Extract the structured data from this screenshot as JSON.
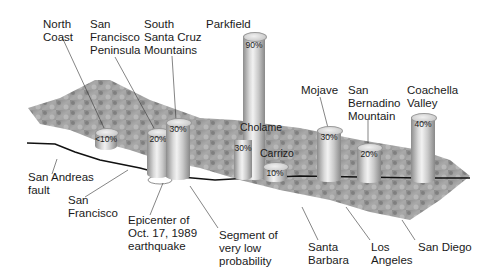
{
  "diagram": {
    "colors": {
      "terrain_dark": "#6f6f6f",
      "terrain_light": "#c8c8c8",
      "fault_line": "#111111",
      "cylinder": "#c4c4c4",
      "text": "#1a1a1a"
    },
    "segments": [
      {
        "name": "North Coast",
        "label": "North\nCoast",
        "probability": "<10%"
      },
      {
        "name": "San Francisco Peninsula",
        "label": "San\nFrancisco\nPeninsula",
        "probability": "20%"
      },
      {
        "name": "South Santa Cruz Mountains",
        "label": "South\nSanta Cruz\nMountains",
        "probability": "30%"
      },
      {
        "name": "Parkfield",
        "label": "Parkfield",
        "probability": "90%"
      },
      {
        "name": "Cholame",
        "label": "Cholame",
        "probability": "30%"
      },
      {
        "name": "Carrizo",
        "label": "Carrizo",
        "probability": "10%"
      },
      {
        "name": "Mojave",
        "label": "Mojave",
        "probability": "30%"
      },
      {
        "name": "San Bernadino Mountain",
        "label": "San\nBernadino\nMountain",
        "probability": "20%"
      },
      {
        "name": "Coachella Valley",
        "label": "Coachella\nValley",
        "probability": "40%"
      }
    ],
    "callouts": [
      {
        "label": "San Andreas\nfault"
      },
      {
        "label": "San\nFrancisco"
      },
      {
        "label": "Epicenter of\nOct. 17, 1989\nearthquake"
      },
      {
        "label": "Segment of\nvery low\nprobability"
      },
      {
        "label": "Santa\nBarbara"
      },
      {
        "label": "Los\nAngeles"
      },
      {
        "label": "San Diego"
      }
    ]
  }
}
